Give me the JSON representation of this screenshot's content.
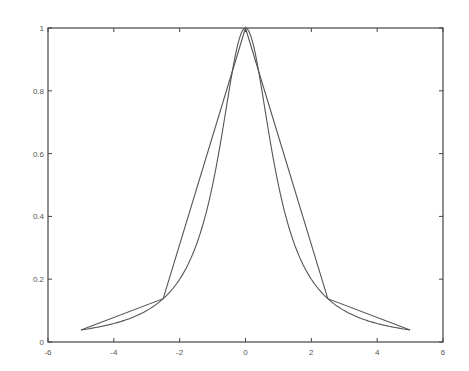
{
  "chart_data": {
    "type": "line",
    "title": "",
    "xlabel": "",
    "ylabel": "",
    "xlim": [
      -6,
      6
    ],
    "ylim": [
      0,
      1
    ],
    "grid": false,
    "legend": null,
    "x_ticks": [
      -6,
      -4,
      -2,
      0,
      2,
      4,
      6
    ],
    "x_tick_labels": [
      "-6",
      "-4",
      "-2",
      "0",
      "2",
      "4",
      "6"
    ],
    "y_ticks": [
      0,
      0.2,
      0.4,
      0.6,
      0.8,
      1
    ],
    "y_tick_labels": [
      "0",
      "0.2",
      "0.4",
      "0.6",
      "0.8",
      "1"
    ],
    "series": [
      {
        "name": "f(x) = 1/(1+x^2)",
        "style": "smooth",
        "x": [
          -5,
          -4.5,
          -4,
          -3.5,
          -3,
          -2.5,
          -2,
          -1.5,
          -1,
          -0.75,
          -0.5,
          -0.25,
          0,
          0.25,
          0.5,
          0.75,
          1,
          1.5,
          2,
          2.5,
          3,
          3.5,
          4,
          4.5,
          5
        ],
        "y": [
          0.0385,
          0.0471,
          0.0588,
          0.0755,
          0.1,
          0.1379,
          0.2,
          0.3077,
          0.5,
          0.64,
          0.8,
          0.9412,
          1,
          0.9412,
          0.8,
          0.64,
          0.5,
          0.3077,
          0.2,
          0.1379,
          0.1,
          0.0755,
          0.0588,
          0.0471,
          0.0385
        ]
      },
      {
        "name": "piecewise linear interpolant",
        "style": "polyline",
        "x": [
          -5,
          -2.5,
          0,
          2.5,
          5
        ],
        "y": [
          0.0385,
          0.1379,
          1,
          0.1379,
          0.0385
        ]
      }
    ],
    "colors": {
      "line": "#555555",
      "axis": "#444444"
    }
  }
}
